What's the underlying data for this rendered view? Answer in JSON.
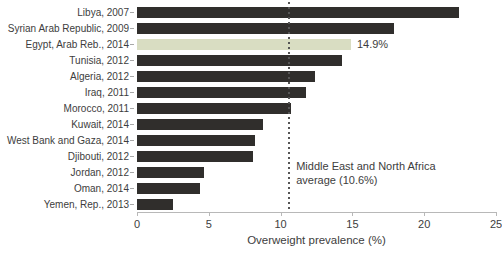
{
  "chart_data": {
    "type": "bar",
    "orientation": "horizontal",
    "title": "",
    "xlabel": "Overweight prevalence (%)",
    "ylabel": "",
    "xlim": [
      0,
      25
    ],
    "xticks": [
      0,
      5,
      10,
      15,
      20,
      25
    ],
    "grid": false,
    "legend": false,
    "categories": [
      "Libya, 2007",
      "Syrian Arab Republic, 2009",
      "Egypt, Arab Reb., 2014",
      "Tunisia, 2012",
      "Algeria, 2012",
      "Iraq, 2011",
      "Morocco, 2011",
      "Kuwait, 2014",
      "West Bank and Gaza, 2014",
      "Djibouti, 2012",
      "Jordan, 2012",
      "Oman, 2014",
      "Yemen, Rep., 2013"
    ],
    "values": [
      22.4,
      17.9,
      14.9,
      14.3,
      12.4,
      11.8,
      10.7,
      8.8,
      8.2,
      8.1,
      4.7,
      4.4,
      2.5
    ],
    "bar_color": "#302e2c",
    "highlight": {
      "index": 2,
      "category": "Egypt, Arab Reb., 2014",
      "value_label": "14.9%",
      "color": "#d9ddc2"
    },
    "reference_line": {
      "value": 10.6,
      "style": "dotted",
      "color": "#555555",
      "label_line1": "Middle East and North Africa",
      "label_line2": "average (10.6%)"
    }
  },
  "colors": {
    "text": "#3d3d3d",
    "axis": "#b8b8b8",
    "tick": "#a8a8a8",
    "background": "#ffffff"
  }
}
